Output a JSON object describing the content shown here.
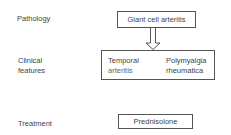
{
  "rows": {
    "pathology": {
      "label": "Pathology",
      "box": "Giant cell arteritis"
    },
    "clinical_features": {
      "label_line1": "Clinical",
      "label_line2": "features",
      "items": [
        {
          "line1": "Temporal",
          "line2": "arteritis"
        },
        {
          "line1": "Polymyalgia",
          "line2": "rheumatica"
        }
      ]
    },
    "treatment": {
      "label": "Treatment",
      "box": "Prednisolone"
    }
  },
  "arrow": {
    "from": "pathology",
    "to": "clinical_features",
    "style": "hollow-double-line"
  }
}
